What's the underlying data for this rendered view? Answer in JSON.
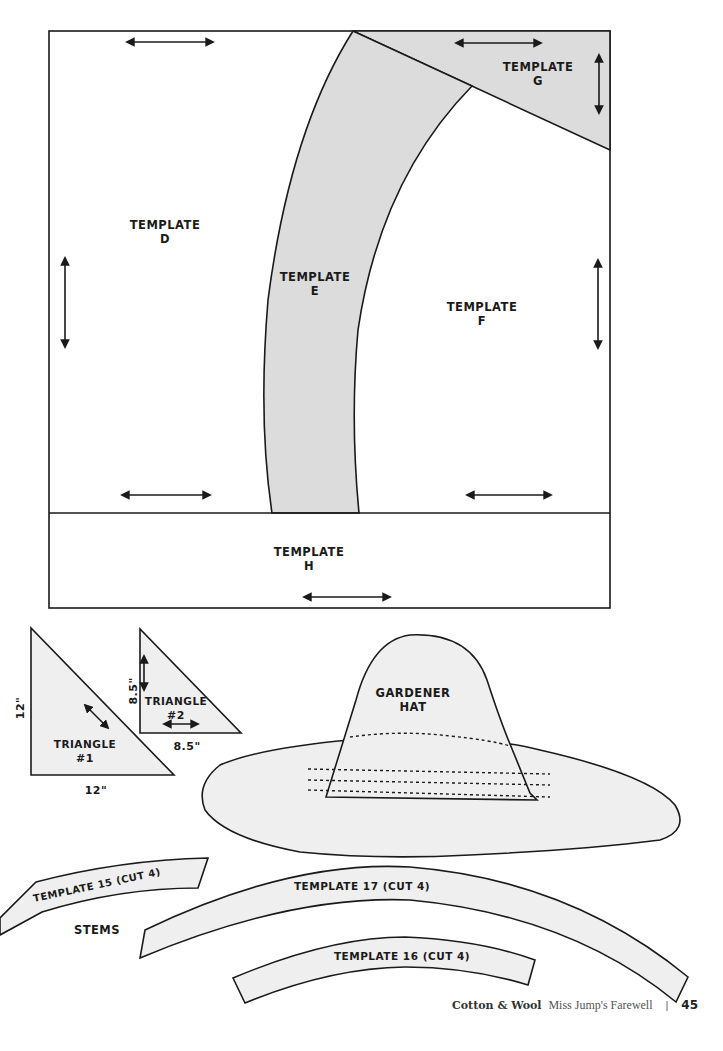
{
  "quilt_block": {
    "templates": [
      {
        "id": "D",
        "label_line1": "TEMPLATE",
        "label_line2": "D"
      },
      {
        "id": "E",
        "label_line1": "TEMPLATE",
        "label_line2": "E"
      },
      {
        "id": "F",
        "label_line1": "TEMPLATE",
        "label_line2": "F"
      },
      {
        "id": "G",
        "label_line1": "TEMPLATE",
        "label_line2": "G"
      },
      {
        "id": "H",
        "label_line1": "TEMPLATE",
        "label_line2": "H"
      }
    ]
  },
  "triangles": [
    {
      "label_line1": "TRIANGLE",
      "label_line2": "#1",
      "side_label": "12\"",
      "base_label": "12\""
    },
    {
      "label_line1": "TRIANGLE",
      "label_line2": "#2",
      "side_label": "8.5\"",
      "base_label": "8.5\""
    }
  ],
  "hat": {
    "label_line1": "GARDENER",
    "label_line2": "HAT"
  },
  "stems": {
    "group_label": "STEMS",
    "pieces": [
      {
        "label": "TEMPLATE 15 (CUT 4)"
      },
      {
        "label": "TEMPLATE 17 (CUT 4)"
      },
      {
        "label": "TEMPLATE 16 (CUT 4)"
      }
    ]
  },
  "footer": {
    "brand": "Cotton & Wool",
    "title": "Miss Jump's Farewell",
    "separator": "|",
    "page_number": "45"
  },
  "colors": {
    "template_fill_grey": "#dcdcdc",
    "piece_fill_light": "#efefef",
    "outline": "#1a1a1a"
  }
}
